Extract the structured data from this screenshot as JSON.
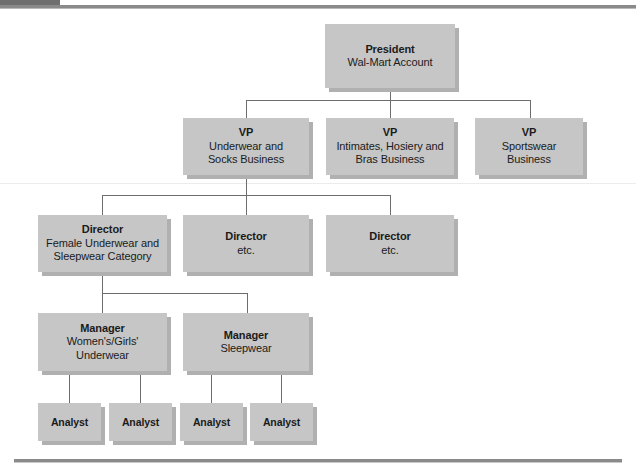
{
  "chart": {
    "kind": "organization-chart",
    "colors": {
      "box_fill": "#c6c6c6",
      "box_shadow": "#b0b0b0",
      "connector": "#6d6d6d",
      "rule": "#8a8a8a",
      "tab": "#6f6f6f",
      "text": "#1b1b1b",
      "background": "#ffffff"
    },
    "levels": [
      {
        "level": 1,
        "role": "President",
        "nodes": [
          {
            "id": "president",
            "title": "President",
            "subtitle": "Wal-Mart Account"
          }
        ]
      },
      {
        "level": 2,
        "role": "VP",
        "nodes": [
          {
            "id": "vp-underwear-socks",
            "title": "VP",
            "subtitle": "Underwear and\nSocks Business"
          },
          {
            "id": "vp-intimates-hosiery-bras",
            "title": "VP",
            "subtitle": "Intimates, Hosiery and\nBras Business"
          },
          {
            "id": "vp-sportswear",
            "title": "VP",
            "subtitle": "Sportswear\nBusiness"
          }
        ]
      },
      {
        "level": 3,
        "role": "Director",
        "nodes": [
          {
            "id": "director-female-underwear-sleepwear",
            "title": "Director",
            "subtitle": "Female Underwear and\nSleepwear Category"
          },
          {
            "id": "director-2",
            "title": "Director",
            "subtitle": "etc."
          },
          {
            "id": "director-3",
            "title": "Director",
            "subtitle": "etc."
          }
        ]
      },
      {
        "level": 4,
        "role": "Manager",
        "nodes": [
          {
            "id": "manager-womens-girls-underwear",
            "title": "Manager",
            "subtitle": "Women's/Girls'\nUnderwear"
          },
          {
            "id": "manager-sleepwear",
            "title": "Manager",
            "subtitle": "Sleepwear"
          }
        ]
      },
      {
        "level": 5,
        "role": "Analyst",
        "nodes": [
          {
            "id": "analyst-1",
            "title": "Analyst",
            "subtitle": ""
          },
          {
            "id": "analyst-2",
            "title": "Analyst",
            "subtitle": ""
          },
          {
            "id": "analyst-3",
            "title": "Analyst",
            "subtitle": ""
          },
          {
            "id": "analyst-4",
            "title": "Analyst",
            "subtitle": ""
          }
        ]
      }
    ]
  }
}
